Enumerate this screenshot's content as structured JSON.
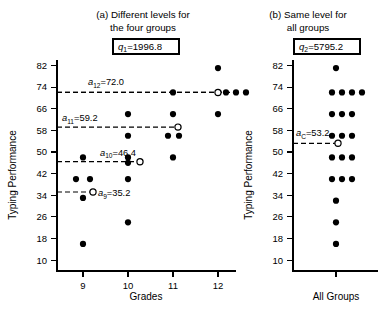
{
  "figure": {
    "background_color": "#ffffff",
    "ink_color": "#000000"
  },
  "panel_a": {
    "title_line1": "(a) Different levels for",
    "title_line2": "the four groups",
    "q_label": "q",
    "q_subscript": "1",
    "q_value": "=1996.8",
    "q_text": "q1=1996.8",
    "xlabel": "Grades",
    "ylabel": "Typing Performance",
    "mean_labels": [
      {
        "name": "a",
        "sub": "9",
        "value": "=35.2",
        "text": "a9=35.2"
      },
      {
        "name": "a",
        "sub": "10",
        "value": "=46.4",
        "text": "a10=46.4"
      },
      {
        "name": "a",
        "sub": "11",
        "value": "=59.2",
        "text": "a11=59.2"
      },
      {
        "name": "a",
        "sub": "12",
        "value": "=72.0",
        "text": "a12=72.0"
      }
    ]
  },
  "panel_b": {
    "title_line1": "(b) Same level for",
    "title_line2": "all groups",
    "q_label": "q",
    "q_subscript": "2",
    "q_value": "=5795.2",
    "q_text": "q2=5795.2",
    "xlabel": "All Groups",
    "ylabel": "Typing Performance",
    "mean_label": {
      "name": "a",
      "sub": "C",
      "value": "=53.2",
      "text": "aC=53.2"
    }
  },
  "chart_data": [
    {
      "type": "scatter",
      "panel": "a",
      "title": "(a) Different levels for the four groups",
      "xlabel": "Grades",
      "ylabel": "Typing Performance",
      "ylim": [
        6,
        84
      ],
      "yticks": [
        10,
        18,
        26,
        34,
        42,
        50,
        58,
        66,
        74,
        82
      ],
      "xcategories": [
        "9",
        "10",
        "11",
        "12"
      ],
      "grid": false,
      "legend": null,
      "annotation_box": "q1=1996.8",
      "series": [
        {
          "name": "Grade 9",
          "x_category": "9",
          "values": [
            48,
            40,
            40,
            33,
            16
          ],
          "group_mean": 35.2,
          "mean_marker": "open-circle",
          "mean_label": "a9=72.0_placeholder_not_used"
        },
        {
          "name": "Grade 10",
          "x_category": "10",
          "values": [
            64,
            56,
            48,
            46,
            40,
            24
          ],
          "group_mean": 46.4,
          "mean_marker": "open-circle"
        },
        {
          "name": "Grade 11",
          "x_category": "11",
          "values": [
            72,
            64,
            56,
            56,
            48
          ],
          "group_mean": 59.2,
          "mean_marker": "open-circle"
        },
        {
          "name": "Grade 12",
          "x_category": "12",
          "values": [
            81,
            72,
            72,
            72,
            64
          ],
          "group_mean": 72.0,
          "mean_marker": "open-circle"
        }
      ],
      "mean_lines": [
        {
          "label": "a9=35.2",
          "value": 35.2
        },
        {
          "label": "a10=46.4",
          "value": 46.4
        },
        {
          "label": "a11=59.2",
          "value": 59.2
        },
        {
          "label": "a12=72.0",
          "value": 72.0
        }
      ]
    },
    {
      "type": "scatter",
      "panel": "b",
      "title": "(b) Same level for all groups",
      "xlabel": "All Groups",
      "ylabel": "Typing Performance",
      "ylim": [
        6,
        84
      ],
      "yticks": [
        10,
        18,
        26,
        34,
        42,
        50,
        58,
        66,
        74,
        82
      ],
      "xcategories": [
        "All Groups"
      ],
      "grid": false,
      "legend": null,
      "annotation_box": "q2=5795.2",
      "stacked_rows": [
        {
          "value": 81,
          "count": 1
        },
        {
          "value": 72,
          "count": 4
        },
        {
          "value": 64,
          "count": 3
        },
        {
          "value": 56,
          "count": 3
        },
        {
          "value": 48,
          "count": 3
        },
        {
          "value": 40,
          "count": 3
        },
        {
          "value": 32,
          "count": 1
        },
        {
          "value": 24,
          "count": 1
        },
        {
          "value": 16,
          "count": 1
        }
      ],
      "grand_mean": 53.2,
      "mean_marker": "open-circle",
      "mean_lines": [
        {
          "label": "aC=53.2",
          "value": 53.2
        }
      ]
    }
  ]
}
